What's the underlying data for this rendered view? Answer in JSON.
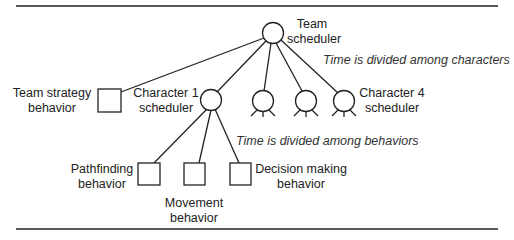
{
  "diagram": {
    "nodes": {
      "team_scheduler": {
        "line1": "Team",
        "line2": "scheduler"
      },
      "team_strategy": {
        "line1": "Team strategy",
        "line2": "behavior"
      },
      "character1": {
        "line1": "Character 1",
        "line2": "scheduler"
      },
      "character4": {
        "line1": "Character 4",
        "line2": "scheduler"
      },
      "pathfinding": {
        "line1": "Pathfinding",
        "line2": "behavior"
      },
      "movement": {
        "line1": "Movement",
        "line2": "behavior"
      },
      "decision": {
        "line1": "Decision making",
        "line2": "behavior"
      }
    },
    "annotations": {
      "characters": "Time is divided among characters",
      "behaviors": "Time is divided among behaviors"
    },
    "colors": {
      "stroke": "#222222",
      "background": "#ffffff"
    }
  }
}
